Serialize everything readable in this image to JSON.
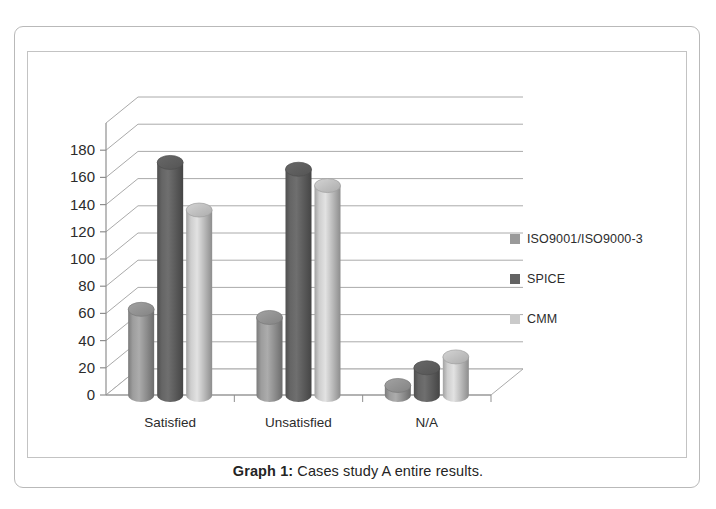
{
  "figure": {
    "caption_label": "Graph 1:",
    "caption_text": " Cases study A entire results."
  },
  "legend": {
    "position": "right",
    "items": [
      {
        "label": "ISO9001/ISO9000-3",
        "color": "#9a9a9a",
        "swatch_name": "legend-swatch-iso"
      },
      {
        "label": "SPICE",
        "color": "#636363",
        "swatch_name": "legend-swatch-spice"
      },
      {
        "label": "CMM",
        "color": "#cacaca",
        "swatch_name": "legend-swatch-cmm"
      }
    ]
  },
  "chart_data": {
    "type": "bar",
    "style": "3d-cylinder-clustered",
    "title": "",
    "xlabel": "",
    "ylabel": "",
    "categories": [
      "Satisfied",
      "Unsatisfied",
      "N/A"
    ],
    "series": [
      {
        "name": "ISO9001/ISO9000-3",
        "color": "#9a9a9a",
        "values": [
          63,
          57,
          7
        ]
      },
      {
        "name": "SPICE",
        "color": "#636363",
        "values": [
          171,
          166,
          20
        ]
      },
      {
        "name": "CMM",
        "color": "#cacaca",
        "values": [
          136,
          154,
          28
        ]
      }
    ],
    "ylim": [
      0,
      180
    ],
    "yticks": [
      0,
      20,
      40,
      60,
      80,
      100,
      120,
      140,
      160,
      180
    ],
    "ytick_labels": [
      "0",
      "20",
      "40",
      "60",
      "80",
      "100",
      "120",
      "140",
      "160",
      "180"
    ],
    "grid": true,
    "grid_axis": "y",
    "legend_position": "right"
  }
}
